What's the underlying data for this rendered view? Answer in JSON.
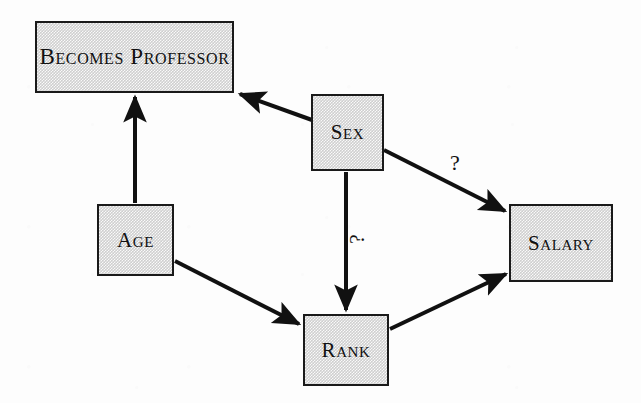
{
  "figure": {
    "type": "causal-diagram",
    "background_color": "#fdfdfd",
    "node_fill_color": "#cfcfcf",
    "node_border_color": "#1a1a1a",
    "edge_color": "#111111",
    "text_color": "#111111"
  },
  "nodes": [
    {
      "id": "becomes_professor",
      "label": "Becomes Professor",
      "x": 35,
      "y": 21,
      "width": 199,
      "height": 72
    },
    {
      "id": "sex",
      "label": "Sex",
      "x": 311,
      "y": 94,
      "width": 73,
      "height": 77
    },
    {
      "id": "age",
      "label": "Age",
      "x": 97,
      "y": 204,
      "width": 77,
      "height": 72
    },
    {
      "id": "salary",
      "label": "Salary",
      "x": 509,
      "y": 204,
      "width": 104,
      "height": 78
    },
    {
      "id": "rank",
      "label": "Rank",
      "x": 303,
      "y": 314,
      "width": 86,
      "height": 72
    }
  ],
  "edges": [
    {
      "id": "age_to_becomes_professor",
      "from": "age",
      "to": "becomes_professor",
      "label": "",
      "arrow": "single"
    },
    {
      "id": "sex_to_becomes_professor",
      "from": "sex",
      "to": "becomes_professor",
      "label": "",
      "arrow": "single"
    },
    {
      "id": "sex_to_salary",
      "from": "sex",
      "to": "salary",
      "label": "?",
      "arrow": "single"
    },
    {
      "id": "sex_to_rank",
      "from": "sex",
      "to": "rank",
      "label": "?",
      "arrow": "single"
    },
    {
      "id": "age_to_rank",
      "from": "age",
      "to": "rank",
      "label": "",
      "arrow": "single"
    },
    {
      "id": "rank_to_salary",
      "from": "rank",
      "to": "salary",
      "label": "",
      "arrow": "single"
    }
  ],
  "edge_labels": {
    "sex_to_salary": "?",
    "sex_to_rank": "?"
  }
}
